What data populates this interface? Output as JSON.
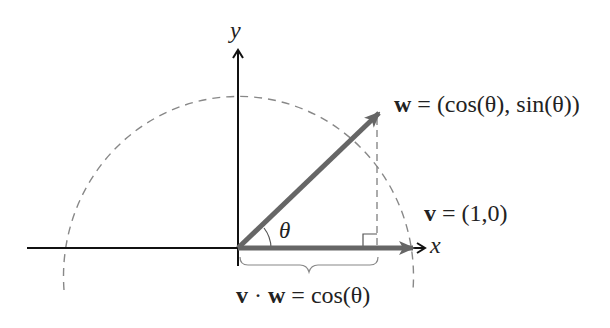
{
  "diagram": {
    "axes": {
      "x_label": "x",
      "y_label": "y"
    },
    "vectors": {
      "w": {
        "name": "w",
        "label": "= (cos(θ), sin(θ))",
        "color": "#666666"
      },
      "v": {
        "name": "v",
        "label": "= (1,0)",
        "color": "#666666"
      }
    },
    "angle_label": "θ",
    "projection_label": {
      "v": "v",
      "dot": "·",
      "w": "w",
      "rest": "= cos(θ)"
    },
    "colors": {
      "axis": "#111111",
      "vector": "#666666",
      "circle": "#888888",
      "text": "#222222"
    }
  }
}
